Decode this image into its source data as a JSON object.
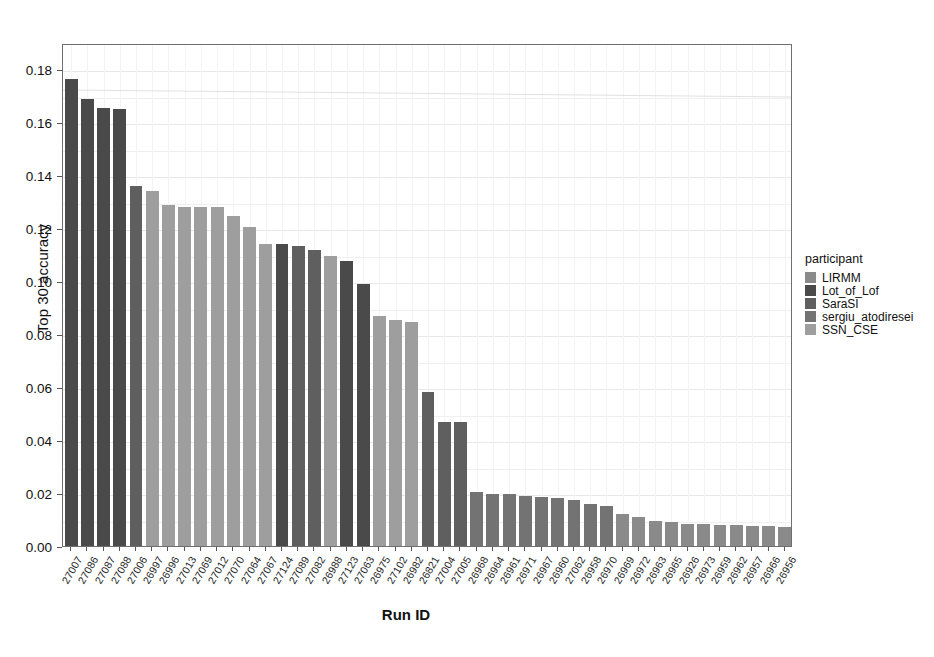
{
  "chart_data": {
    "type": "bar",
    "title": "",
    "xlabel": "Run ID",
    "ylabel": "Top 30 accuracy",
    "ylim": [
      0,
      0.19
    ],
    "yticks": [
      0.0,
      0.02,
      0.04,
      0.06,
      0.08,
      0.1,
      0.12,
      0.14,
      0.16,
      0.18
    ],
    "ytick_labels": [
      "0.00",
      "0.02",
      "0.04",
      "0.06",
      "0.08",
      "0.10",
      "0.12",
      "0.14",
      "0.16",
      "0.18"
    ],
    "grid": true,
    "legend_position": "right",
    "legend_title": "participant",
    "series_key": "participant",
    "legend_entries": [
      {
        "name": "LIRMM",
        "color": "#8a8a8a"
      },
      {
        "name": "Lot_of_Lof",
        "color": "#4a4a4a"
      },
      {
        "name": "SaraSI",
        "color": "#5f5f5f"
      },
      {
        "name": "sergiu_atodiresei",
        "color": "#737373"
      },
      {
        "name": "SSN_CSE",
        "color": "#9e9e9e"
      }
    ],
    "categories": [
      "27007",
      "27086",
      "27087",
      "27088",
      "27006",
      "26997",
      "26996",
      "27013",
      "27069",
      "27012",
      "27070",
      "27064",
      "27067",
      "27124",
      "27089",
      "27082",
      "26988",
      "27123",
      "27063",
      "26975",
      "27102",
      "26982",
      "26821",
      "27004",
      "27005",
      "26968",
      "26964",
      "26961",
      "26971",
      "26967",
      "26960",
      "27062",
      "26958",
      "26970",
      "26969",
      "26972",
      "26963",
      "26965",
      "26926",
      "26973",
      "26959",
      "26962",
      "26957",
      "26966",
      "26956"
    ],
    "values": [
      0.1765,
      0.169,
      0.1655,
      0.165,
      0.136,
      0.134,
      0.129,
      0.128,
      0.128,
      0.128,
      0.1245,
      0.1205,
      0.114,
      0.114,
      0.1135,
      0.112,
      0.1095,
      0.1075,
      0.099,
      0.087,
      0.0855,
      0.0845,
      0.058,
      0.047,
      0.047,
      0.0205,
      0.0195,
      0.0195,
      0.019,
      0.0185,
      0.018,
      0.0175,
      0.016,
      0.015,
      0.012,
      0.011,
      0.0095,
      0.009,
      0.0085,
      0.0085,
      0.008,
      0.008,
      0.0075,
      0.0075,
      0.007
    ],
    "bar_participants": [
      "Lot_of_Lof",
      "Lot_of_Lof",
      "Lot_of_Lof",
      "Lot_of_Lof",
      "SaraSI",
      "SSN_CSE",
      "SSN_CSE",
      "SSN_CSE",
      "SSN_CSE",
      "SSN_CSE",
      "SSN_CSE",
      "SSN_CSE",
      "SSN_CSE",
      "Lot_of_Lof",
      "SaraSI",
      "SaraSI",
      "SSN_CSE",
      "Lot_of_Lof",
      "Lot_of_Lof",
      "SSN_CSE",
      "SSN_CSE",
      "SSN_CSE",
      "SaraSI",
      "SaraSI",
      "SaraSI",
      "sergiu_atodiresei",
      "sergiu_atodiresei",
      "sergiu_atodiresei",
      "sergiu_atodiresei",
      "sergiu_atodiresei",
      "sergiu_atodiresei",
      "sergiu_atodiresei",
      "sergiu_atodiresei",
      "sergiu_atodiresei",
      "LIRMM",
      "LIRMM",
      "LIRMM",
      "LIRMM",
      "LIRMM",
      "LIRMM",
      "LIRMM",
      "LIRMM",
      "LIRMM",
      "LIRMM",
      "LIRMM"
    ]
  }
}
